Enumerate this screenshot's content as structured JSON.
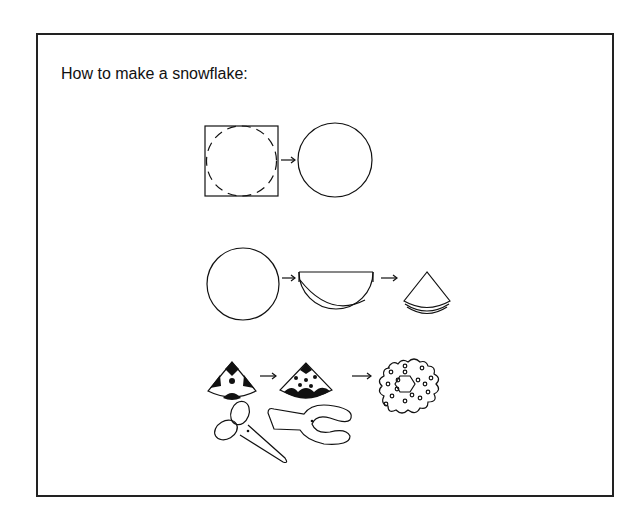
{
  "title": "How to make a snowflake:",
  "colors": {
    "ink": "#111111",
    "background": "#ffffff",
    "frame": "#222222"
  },
  "steps": [
    {
      "step": 1,
      "description": "square paper with dashed circle cut guide",
      "arrow": "→",
      "result": "cut circle"
    },
    {
      "step": 2,
      "description": "circle folded in half",
      "arrow": "→",
      "result": "semicircle folded into wedge"
    },
    {
      "step": 3,
      "description": "cut shapes out of folded wedge",
      "arrow": "→",
      "result": "unfolded snowflake"
    }
  ],
  "tools": [
    "scissors-icon",
    "hole-punch-icon"
  ]
}
